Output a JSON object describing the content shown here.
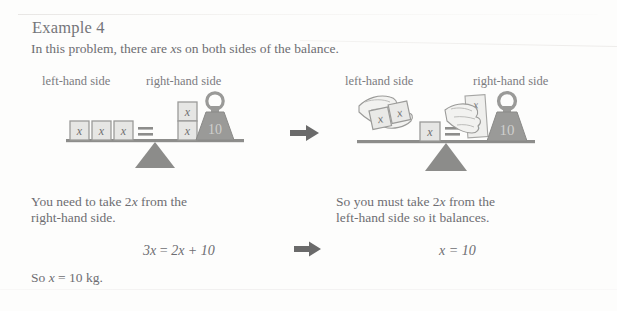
{
  "page": {
    "title": "Example 4",
    "intro_pre": "In this problem, there are ",
    "intro_var": "x",
    "intro_post": "s on both sides of the balance."
  },
  "labels": {
    "left_hand_side": "left-hand side",
    "right_hand_side": "right-hand side"
  },
  "diagram_left": {
    "name": "balance-before",
    "left_pan_boxes": [
      "x",
      "x",
      "x"
    ],
    "equals_sign": "=",
    "right_pan_boxes": [
      "x",
      "x"
    ],
    "weight_label": "10",
    "box_count_left": 3,
    "box_count_right": 2
  },
  "diagram_right": {
    "name": "balance-after",
    "removed_left_boxes": [
      "x",
      "x"
    ],
    "remaining_left_boxes": [
      "x"
    ],
    "equals_sign": "=",
    "removed_right_boxes": [
      "x",
      "x"
    ],
    "weight_label": "10",
    "hand_left_name": "hand-removing-two-x-left",
    "hand_right_name": "hand-removing-two-x-right"
  },
  "explain_left": {
    "line1_pre": "You need to take 2",
    "line1_var": "x",
    "line1_post": " from the",
    "line2": "right-hand side."
  },
  "explain_right": {
    "line1_pre": "So you must take 2",
    "line1_var": "x",
    "line1_post": " from the",
    "line2": "left-hand side so it balances."
  },
  "equations": {
    "left_lhs": "3x",
    "left_eq": "=",
    "left_rhs": "2x + 10",
    "left_full": "3x = 2x + 10",
    "right_full": "x = 10"
  },
  "conclusion": {
    "pre": "So ",
    "var": "x",
    "post": " = 10 kg."
  },
  "arrows": {
    "top_arrow": "right-arrow",
    "eq_arrow": "right-arrow"
  },
  "colors": {
    "page_bg": "#fdfdfc",
    "text": "#6d6d72",
    "title": "#75757a",
    "box_fill": "#e6e6e4",
    "box_stroke": "#9b9b99",
    "weight_fill": "#9a9a98",
    "beam": "#8d8d8b",
    "fulcrum": "#8c8c8a",
    "arrow": "#6a6a6a"
  }
}
